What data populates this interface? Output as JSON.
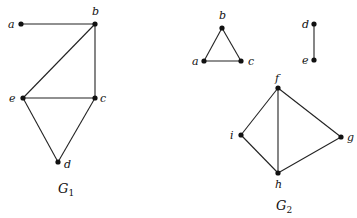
{
  "graphs": [
    {
      "name": "G",
      "subscript": "1",
      "label_pos": [
        58,
        193
      ],
      "nodes": [
        {
          "id": "a",
          "x": 21,
          "y": 24,
          "lx": 8,
          "ly": 28
        },
        {
          "id": "b",
          "x": 95,
          "y": 24,
          "lx": 92,
          "ly": 15
        },
        {
          "id": "e",
          "x": 23,
          "y": 98,
          "lx": 9,
          "ly": 102
        },
        {
          "id": "c",
          "x": 95,
          "y": 98,
          "lx": 100,
          "ly": 102
        },
        {
          "id": "d",
          "x": 58,
          "y": 162,
          "lx": 64,
          "ly": 168
        }
      ],
      "edges": [
        [
          "a",
          "b"
        ],
        [
          "b",
          "e"
        ],
        [
          "b",
          "c"
        ],
        [
          "e",
          "c"
        ],
        [
          "e",
          "d"
        ],
        [
          "c",
          "d"
        ]
      ]
    },
    {
      "name": "G",
      "subscript": "2",
      "label_pos": [
        276,
        210
      ],
      "nodes": [
        {
          "id": "b",
          "x": 222,
          "y": 28,
          "lx": 219,
          "ly": 19
        },
        {
          "id": "a",
          "x": 204,
          "y": 61,
          "lx": 192,
          "ly": 65
        },
        {
          "id": "c",
          "x": 241,
          "y": 61,
          "lx": 248,
          "ly": 65
        },
        {
          "id": "d",
          "x": 314,
          "y": 24,
          "lx": 302,
          "ly": 28
        },
        {
          "id": "e",
          "x": 314,
          "y": 60,
          "lx": 302,
          "ly": 64
        },
        {
          "id": "f",
          "x": 278,
          "y": 88,
          "lx": 275,
          "ly": 82
        },
        {
          "id": "i",
          "x": 241,
          "y": 135,
          "lx": 230,
          "ly": 139
        },
        {
          "id": "g",
          "x": 341,
          "y": 137,
          "lx": 347,
          "ly": 141
        },
        {
          "id": "h",
          "x": 278,
          "y": 173,
          "lx": 275,
          "ly": 188
        }
      ],
      "edges": [
        [
          "b",
          "a"
        ],
        [
          "b",
          "c"
        ],
        [
          "a",
          "c"
        ],
        [
          "d",
          "e"
        ],
        [
          "f",
          "i"
        ],
        [
          "f",
          "h"
        ],
        [
          "f",
          "g"
        ],
        [
          "i",
          "h"
        ],
        [
          "h",
          "g"
        ]
      ]
    }
  ]
}
